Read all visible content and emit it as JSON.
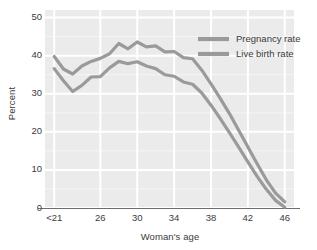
{
  "chart_data": {
    "type": "line",
    "title": "",
    "xlabel": "Woman's age",
    "ylabel": "Percent",
    "grid": true,
    "legend_position": "top-right",
    "xtick_labels": [
      "<21",
      "26",
      "30",
      "34",
      "38",
      "42",
      "46"
    ],
    "xtick_values": [
      21,
      26,
      30,
      34,
      38,
      42,
      46
    ],
    "ytick_labels": [
      "0",
      "10",
      "20",
      "30",
      "40",
      "50"
    ],
    "ytick_values": [
      0,
      10,
      20,
      30,
      40,
      50
    ],
    "xlim": [
      20,
      47
    ],
    "ylim": [
      0,
      52
    ],
    "line_color": "#9a9a9a",
    "plot_background": "#ebebeb",
    "grid_color": "#ffffff",
    "x": [
      21,
      22,
      23,
      24,
      25,
      26,
      27,
      28,
      29,
      30,
      31,
      32,
      33,
      34,
      35,
      36,
      37,
      38,
      39,
      40,
      41,
      42,
      43,
      44,
      45,
      46
    ],
    "series": [
      {
        "name": "Pregnancy rate",
        "values": [
          39.8,
          36.5,
          35.2,
          37.3,
          38.5,
          39.3,
          40.5,
          43.2,
          41.8,
          43.6,
          42.3,
          42.6,
          41.0,
          41.1,
          39.5,
          39.2,
          36.2,
          32.6,
          28.8,
          24.8,
          20.4,
          16.0,
          11.6,
          7.4,
          3.9,
          1.6
        ]
      },
      {
        "name": "Live birth rate",
        "values": [
          36.6,
          33.4,
          30.6,
          32.2,
          34.4,
          34.5,
          36.8,
          38.5,
          37.9,
          38.4,
          37.3,
          36.6,
          35.0,
          34.6,
          33.1,
          32.5,
          30.2,
          27.0,
          23.5,
          19.8,
          16.0,
          12.1,
          8.3,
          4.9,
          2.0,
          0.2
        ]
      }
    ]
  },
  "legend": {
    "items": [
      {
        "label": "Pregnancy rate",
        "color": "#9a9a9a"
      },
      {
        "label": "Live birth rate",
        "color": "#9a9a9a"
      }
    ]
  }
}
